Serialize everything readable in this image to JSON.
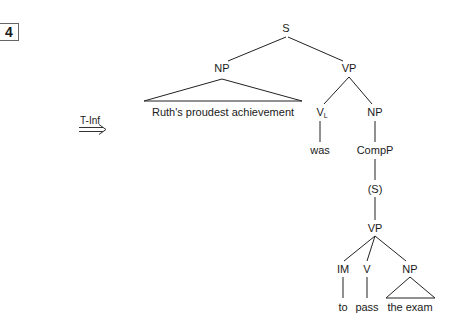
{
  "example_number": "4",
  "transformation": {
    "label": "T-Inf",
    "arrow": "double-right-arrow"
  },
  "tree": {
    "root": "S",
    "subject_np": {
      "label": "NP",
      "terminal": "Ruth's proudest achievement"
    },
    "vp": {
      "label": "VP",
      "verb": {
        "label": "V",
        "subscript": "L",
        "terminal": "was"
      },
      "np": {
        "label": "NP",
        "compp": "CompP",
        "s": "(S)",
        "inner_vp": {
          "label": "VP",
          "im": {
            "label": "IM",
            "terminal": "to"
          },
          "v": {
            "label": "V",
            "terminal": "pass"
          },
          "np": {
            "label": "NP",
            "terminal": "the exam"
          }
        }
      }
    }
  }
}
